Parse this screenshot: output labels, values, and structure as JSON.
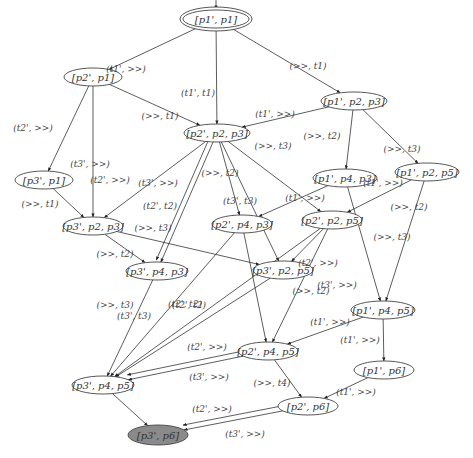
{
  "diagram": {
    "type": "state-transition-graph",
    "nodes": [
      {
        "id": "n0",
        "label": "[p1', p1]",
        "x": 216,
        "y": 19,
        "rx": 33,
        "ry": 9,
        "initial": true
      },
      {
        "id": "n1",
        "label": "[p2', p1]",
        "x": 93,
        "y": 77,
        "rx": 29,
        "ry": 9
      },
      {
        "id": "n2",
        "label": "[p1', p2, p3]",
        "x": 354,
        "y": 101,
        "rx": 33,
        "ry": 9
      },
      {
        "id": "n3",
        "label": "[p2', p2, p3]",
        "x": 217,
        "y": 133,
        "rx": 33,
        "ry": 9
      },
      {
        "id": "n4",
        "label": "[p3', p1]",
        "x": 44,
        "y": 180,
        "rx": 29,
        "ry": 9
      },
      {
        "id": "n5",
        "label": "[p1', p4, p3]",
        "x": 345,
        "y": 178,
        "rx": 32,
        "ry": 9
      },
      {
        "id": "n6",
        "label": "[p1', p2, p5]",
        "x": 427,
        "y": 172,
        "rx": 32,
        "ry": 9
      },
      {
        "id": "n7",
        "label": "[p3', p2, p3]",
        "x": 93,
        "y": 226,
        "rx": 30,
        "ry": 9
      },
      {
        "id": "n8",
        "label": "[p2', p4, p3]",
        "x": 242,
        "y": 224,
        "rx": 30,
        "ry": 9
      },
      {
        "id": "n9",
        "label": "[p2', p2, p5]",
        "x": 332,
        "y": 220,
        "rx": 30,
        "ry": 9
      },
      {
        "id": "n10",
        "label": "[p3', p4, p3]",
        "x": 157,
        "y": 271,
        "rx": 31,
        "ry": 9
      },
      {
        "id": "n11",
        "label": "[p3', p2, p5]",
        "x": 283,
        "y": 270,
        "rx": 30,
        "ry": 9
      },
      {
        "id": "n12",
        "label": "[p1', p4, p5]",
        "x": 383,
        "y": 310,
        "rx": 32,
        "ry": 9
      },
      {
        "id": "n13",
        "label": "[p2', p4, p5]",
        "x": 268,
        "y": 351,
        "rx": 30,
        "ry": 9
      },
      {
        "id": "n14",
        "label": "[p1', p6]",
        "x": 384,
        "y": 370,
        "rx": 30,
        "ry": 9
      },
      {
        "id": "n15",
        "label": "[p3', p4, p5]",
        "x": 103,
        "y": 385,
        "rx": 31,
        "ry": 9
      },
      {
        "id": "n16",
        "label": "[p2', p6]",
        "x": 308,
        "y": 406,
        "rx": 30,
        "ry": 9
      },
      {
        "id": "n17",
        "label": "[p3', p6]",
        "x": 158,
        "y": 435,
        "rx": 30,
        "ry": 10,
        "final": true
      }
    ],
    "edges": [
      {
        "from": "n0",
        "to": "n1",
        "label": "(t1', >>)",
        "lx": 126,
        "ly": 69
      },
      {
        "from": "n0",
        "to": "n3",
        "label": "(t1', t1)",
        "lx": 198,
        "ly": 93
      },
      {
        "from": "n0",
        "to": "n2",
        "label": "(>>, t1)",
        "lx": 308,
        "ly": 66
      },
      {
        "from": "n1",
        "to": "n4",
        "label": "(t2', >>)",
        "lx": 33,
        "ly": 128
      },
      {
        "from": "n1",
        "to": "n7",
        "label": "(t3', >>)",
        "lx": 90,
        "ly": 164
      },
      {
        "from": "n1",
        "to": "n3",
        "label": "(>>, t1)",
        "lx": 160,
        "ly": 116
      },
      {
        "from": "n2",
        "to": "n3",
        "label": "(t1', >>)",
        "lx": 275,
        "ly": 114
      },
      {
        "from": "n2",
        "to": "n5",
        "label": "(>>, t2)",
        "lx": 322,
        "ly": 136
      },
      {
        "from": "n2",
        "to": "n6",
        "label": "(>>, t3)",
        "lx": 402,
        "ly": 149
      },
      {
        "from": "n3",
        "to": "n7",
        "label": "(t2', >>)",
        "lx": 110,
        "ly": 180
      },
      {
        "from": "n3",
        "to": "n10",
        "label": "(t3', >>)",
        "lx": 158,
        "ly": 183
      },
      {
        "from": "n3",
        "to": "n10",
        "label": "(t2', t2)",
        "lx": 160,
        "ly": 206
      },
      {
        "from": "n3",
        "to": "n8",
        "label": "(>>, t2)",
        "lx": 220,
        "ly": 173
      },
      {
        "from": "n3",
        "to": "n11",
        "label": "(t3', t3)",
        "lx": 240,
        "ly": 201
      },
      {
        "from": "n3",
        "to": "n9",
        "label": "(>>, t3)",
        "lx": 273,
        "ly": 146
      },
      {
        "from": "n4",
        "to": "n7",
        "label": "(>>, t1)",
        "lx": 40,
        "ly": 204
      },
      {
        "from": "n7",
        "to": "n10",
        "label": "(>>, t2)",
        "lx": 115,
        "ly": 254
      },
      {
        "from": "n7",
        "to": "n11",
        "label": "(>>, t3)",
        "lx": 153,
        "ly": 228
      },
      {
        "from": "n5",
        "to": "n8",
        "label": "(t1', >>)",
        "lx": 305,
        "ly": 198
      },
      {
        "from": "n5",
        "to": "n12",
        "label": "(>>, t3)",
        "lx": 392,
        "ly": 237
      },
      {
        "from": "n6",
        "to": "n9",
        "label": "(t1', >>)",
        "lx": 383,
        "ly": 183
      },
      {
        "from": "n6",
        "to": "n12",
        "label": "(>>, t2)",
        "lx": 409,
        "ly": 207
      },
      {
        "from": "n8",
        "to": "n15",
        "label": "(t2', t2)",
        "lx": 189,
        "ly": 305
      },
      {
        "from": "n8",
        "to": "n13",
        "label": "(>>, t3)",
        "lx": 115,
        "ly": 305
      },
      {
        "from": "n9",
        "to": "n15",
        "label": "(t2', >>)",
        "lx": 318,
        "ly": 263
      },
      {
        "from": "n9",
        "to": "n13",
        "label": "(t3', >>)",
        "lx": 337,
        "ly": 285
      },
      {
        "from": "n9",
        "to": "n11",
        "label": "(>>, t2)",
        "lx": 311,
        "ly": 291
      },
      {
        "from": "n10",
        "to": "n15",
        "label": "(t3', t3)",
        "lx": 134,
        "ly": 316
      },
      {
        "from": "n11",
        "to": "n15",
        "label": "(t2', t2)",
        "lx": 185,
        "ly": 304
      },
      {
        "from": "n12",
        "to": "n13",
        "label": "(t1', >>)",
        "lx": 330,
        "ly": 322
      },
      {
        "from": "n12",
        "to": "n14",
        "label": "(t1', >>)",
        "lx": 360,
        "ly": 340
      },
      {
        "from": "n13",
        "to": "n15",
        "label": "(t2', >>)",
        "lx": 207,
        "ly": 347
      },
      {
        "from": "n13",
        "to": "n15",
        "label": "(t3', >>)",
        "lx": 209,
        "ly": 377
      },
      {
        "from": "n13",
        "to": "n16",
        "label": "(>>, t4)",
        "lx": 272,
        "ly": 383
      },
      {
        "from": "n14",
        "to": "n16",
        "label": "(t1', >>)",
        "lx": 356,
        "ly": 392
      },
      {
        "from": "n15",
        "to": "n17",
        "label": "",
        "lx": 0,
        "ly": 0
      },
      {
        "from": "n16",
        "to": "n17",
        "label": "(t2', >>)",
        "lx": 212,
        "ly": 409
      },
      {
        "from": "n16",
        "to": "n17",
        "label": "(t3', >>)",
        "lx": 245,
        "ly": 434
      }
    ]
  },
  "colors": {
    "final_node_fill": "#8a8a8a",
    "stroke": "#444444",
    "background": "#ffffff"
  }
}
